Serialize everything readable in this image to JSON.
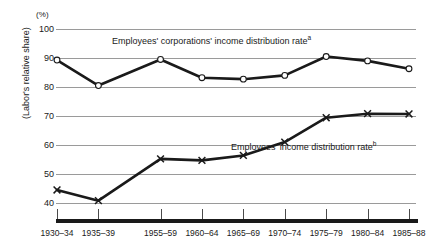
{
  "chart_data": {
    "type": "line",
    "title": "",
    "subtitle": "",
    "xlabel": "",
    "ylabel": "(Labor's relative share)",
    "unit_label": "(%)",
    "ylim": [
      40,
      100
    ],
    "yticks": [
      100,
      90,
      80,
      70,
      60,
      50,
      40
    ],
    "grid": true,
    "legend_position": "inline-annotation",
    "categories": [
      "1930–34",
      "1935–39",
      "1955–59",
      "1960–64",
      "1965–69",
      "1970–74",
      "1975–79",
      "1980–84",
      "1985–88"
    ],
    "series": [
      {
        "name": "Employees' corporations' income distribution rate",
        "footnote_marker": "a",
        "marker": "open-circle",
        "values": [
          89.3,
          80.5,
          89.5,
          83.2,
          82.7,
          84.0,
          90.5,
          89.0,
          86.3
        ]
      },
      {
        "name": "Employees' income distribution rate",
        "footnote_marker": "b",
        "marker": "cross",
        "values": [
          44.5,
          40.8,
          55.2,
          54.7,
          56.4,
          61.0,
          69.4,
          70.8,
          70.7
        ]
      }
    ],
    "annotations": [
      {
        "id": "annot-upper",
        "text": "Employees' corporations' income distribution rate",
        "superscript": "a"
      },
      {
        "id": "annot-lower",
        "text": "Employees' income distribution rate",
        "superscript": "b"
      }
    ],
    "colors": {
      "line": "#1a1a1a",
      "grid": "#9a9a9a",
      "axis": "#1a1a1a",
      "background": "#ffffff",
      "marker_fill": "#ffffff"
    }
  }
}
